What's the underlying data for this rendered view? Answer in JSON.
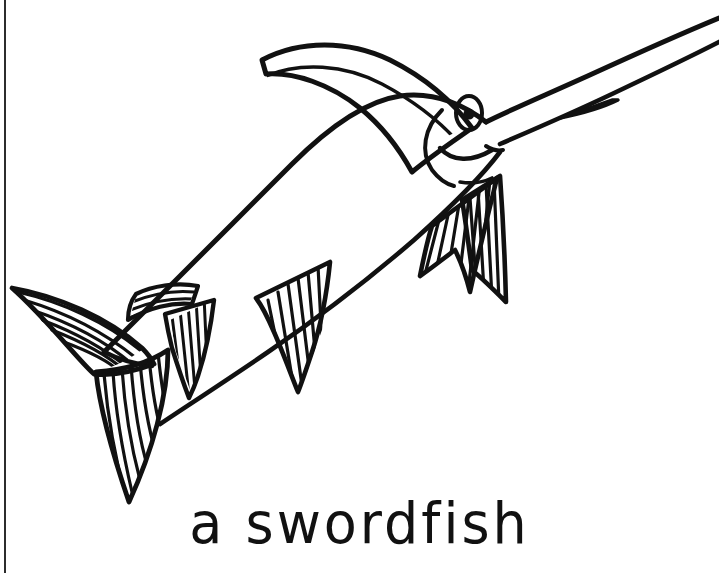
{
  "page": {
    "title": "a swordfish",
    "kind": "coloring-book-line-drawing",
    "width": 719,
    "height": 573,
    "background_color": "#ffffff",
    "ink_color": "#111111"
  },
  "caption": {
    "text": "a swordfish",
    "color": "#111111"
  },
  "artwork": {
    "subject": "swordfish",
    "style": "hand-drawn black ink outline with parallel line hatching, uncolored",
    "orientation": "body angled from lower-left tail to upper-right bill",
    "parts": [
      {
        "name": "bill",
        "label": "long pointed sword bill extending off the top-right edge"
      },
      {
        "name": "head",
        "label": "head with eye and smiling mouth"
      },
      {
        "name": "eye",
        "label": "oval eye outline with solid round pupil"
      },
      {
        "name": "mouth",
        "label": "curved smiling mouth line"
      },
      {
        "name": "gill",
        "label": "curved gill cover line behind the eye"
      },
      {
        "name": "dorsal-fin",
        "label": "tall sail-like dorsal fin with concentric arc hatching"
      },
      {
        "name": "pectoral-fin",
        "label": "two-lobed pectoral fin with vertical hatching"
      },
      {
        "name": "ventral-fin",
        "label": "striped ventral fin below the belly"
      },
      {
        "name": "anal-fin",
        "label": "striped anal fin toward the rear belly"
      },
      {
        "name": "finlet",
        "label": "small hatched finlet near the tail peduncle"
      },
      {
        "name": "tail-upper-lobe",
        "label": "upper crescent tail lobe with curved hatching"
      },
      {
        "name": "tail-lower-lobe",
        "label": "lower crescent tail lobe with vertical hatching"
      },
      {
        "name": "body",
        "label": "smooth tapering body outline"
      }
    ]
  },
  "scan_edge": {
    "label": "dark page-edge scan artifact along the left border",
    "color": "#1a1a1a"
  }
}
